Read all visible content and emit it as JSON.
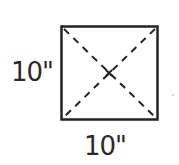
{
  "diagram": {
    "shape": "square",
    "height_label": "10\"",
    "width_label": "10\"",
    "diagonals": "dashed",
    "center_mark": "x",
    "stroke_color": "#222222"
  }
}
